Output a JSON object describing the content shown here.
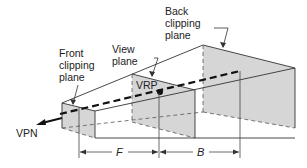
{
  "diagram": {
    "labels": {
      "back_clipping_plane": [
        "Back",
        "clipping",
        "plane"
      ],
      "view_plane": [
        "View",
        "plane"
      ],
      "front_clipping_plane": [
        "Front",
        "clipping",
        "plane"
      ],
      "vrp": "VRP",
      "vpn": "VPN",
      "front_distance": "F",
      "back_distance": "B"
    },
    "colors": {
      "plane_fill": "#d4d4d4",
      "line": "#333333",
      "background": "#ffffff"
    }
  }
}
